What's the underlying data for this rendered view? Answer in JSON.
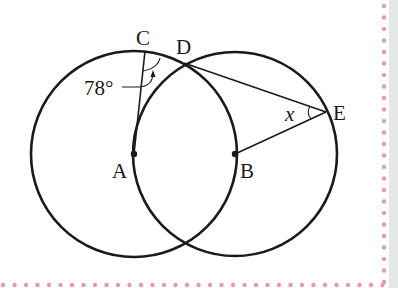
{
  "figure": {
    "type": "geometry",
    "points": {
      "A": {
        "label": "A",
        "x": 134,
        "y": 154
      },
      "B": {
        "label": "B",
        "x": 235,
        "y": 154
      },
      "C": {
        "label": "C",
        "x": 145,
        "y": 51
      },
      "D": {
        "label": "D",
        "x": 184,
        "y": 63
      },
      "E": {
        "label": "E",
        "x": 326,
        "y": 112
      }
    },
    "angle_label": "78°",
    "unknown_label": "x",
    "colors": {
      "stroke": "#1a1a1a",
      "border_dots": "#e89aa8",
      "side_band": "#e6e8e6"
    }
  }
}
